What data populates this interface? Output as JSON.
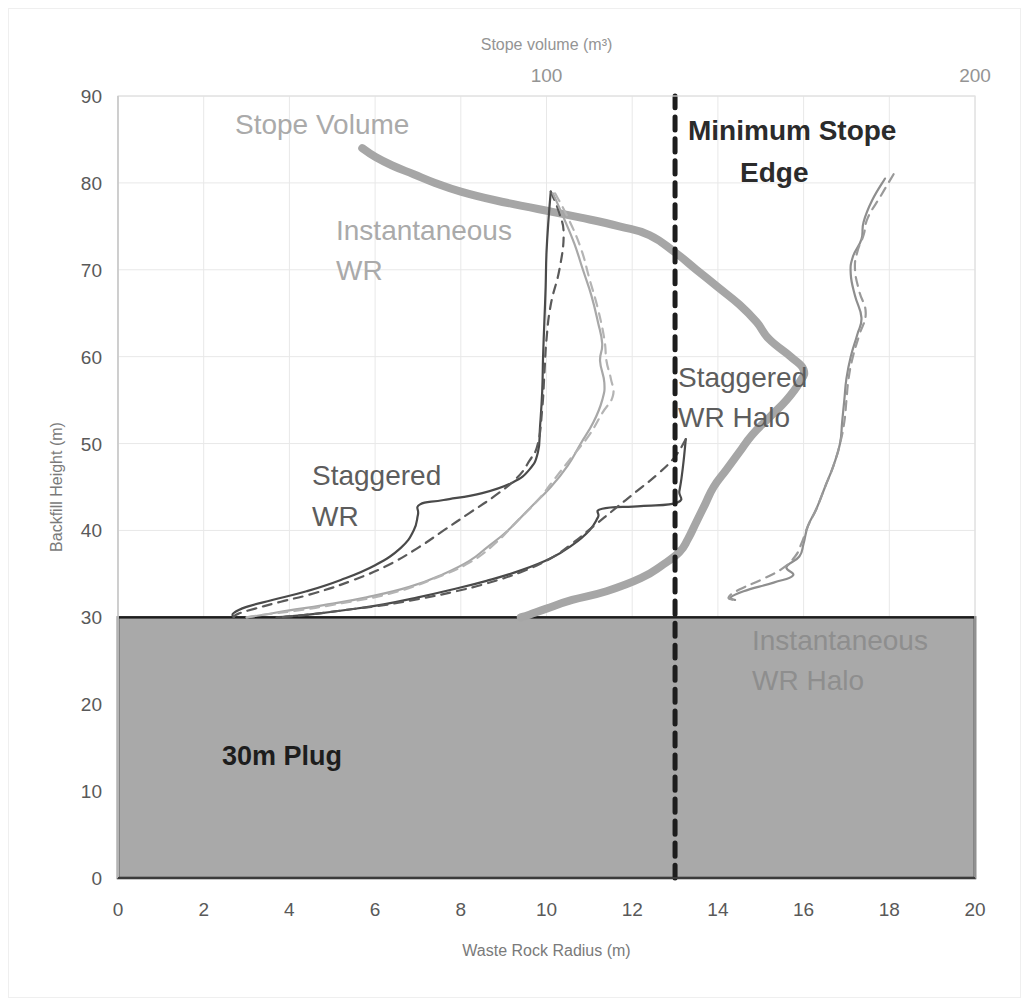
{
  "chart_data": {
    "type": "line",
    "title": "",
    "xlabel": "Waste Rock Radius (m)",
    "ylabel": "Backfill Height (m)",
    "x2label": "Stope volume (m³)",
    "xlim": [
      0,
      20
    ],
    "ylim": [
      0,
      90
    ],
    "x2lim": [
      0,
      200
    ],
    "xticks": [
      0,
      2,
      4,
      6,
      8,
      10,
      12,
      14,
      16,
      18,
      20
    ],
    "yticks": [
      0,
      10,
      20,
      30,
      40,
      50,
      60,
      70,
      80,
      90
    ],
    "x2ticks": [
      100,
      200
    ],
    "grid": true,
    "legend_position": "inline-annotations",
    "series": [
      {
        "name": "Stope Volume",
        "style": "solid-thick",
        "color": "#a6a6a6",
        "axis": "x2",
        "points": [
          [
            57,
            84.0
          ],
          [
            60,
            83.0
          ],
          [
            64,
            82.0
          ],
          [
            69,
            81.0
          ],
          [
            74,
            80.0
          ],
          [
            80,
            79.0
          ],
          [
            88,
            78.0
          ],
          [
            98,
            77.0
          ],
          [
            108,
            76.0
          ],
          [
            117,
            75.0
          ],
          [
            124,
            74.0
          ],
          [
            130,
            72.0
          ],
          [
            135,
            70.0
          ],
          [
            140,
            68.0
          ],
          [
            145,
            66.0
          ],
          [
            149,
            64.0
          ],
          [
            152,
            62.0
          ],
          [
            157,
            60.0
          ],
          [
            160,
            58.5
          ],
          [
            159,
            57.0
          ],
          [
            156,
            55.0
          ],
          [
            152,
            53.0
          ],
          [
            148,
            51.0
          ],
          [
            145,
            49.0
          ],
          [
            142,
            47.0
          ],
          [
            139,
            45.0
          ],
          [
            137,
            43.0
          ],
          [
            135,
            41.0
          ],
          [
            133,
            39.0
          ],
          [
            131,
            37.5
          ],
          [
            127,
            36.0
          ],
          [
            122,
            34.5
          ],
          [
            114,
            33.0
          ],
          [
            106,
            32.0
          ],
          [
            100,
            31.0
          ],
          [
            96,
            30.3
          ],
          [
            94,
            30.0
          ]
        ]
      },
      {
        "name": "Staggered WR",
        "style": "solid-thin",
        "color": "#4a4a4a",
        "axis": "x1",
        "points": [
          [
            10.1,
            79.0
          ],
          [
            10.05,
            76.0
          ],
          [
            10.0,
            72.0
          ],
          [
            9.98,
            68.0
          ],
          [
            9.95,
            64.0
          ],
          [
            9.92,
            60.0
          ],
          [
            9.9,
            56.0
          ],
          [
            9.85,
            52.0
          ],
          [
            9.8,
            49.0
          ],
          [
            9.6,
            47.0
          ],
          [
            9.2,
            45.5
          ],
          [
            8.5,
            44.3
          ],
          [
            7.6,
            43.5
          ],
          [
            7.05,
            43.0
          ],
          [
            7.0,
            41.8
          ],
          [
            6.9,
            40.0
          ],
          [
            6.6,
            38.0
          ],
          [
            6.0,
            36.0
          ],
          [
            5.2,
            34.3
          ],
          [
            4.4,
            33.0
          ],
          [
            3.6,
            32.0
          ],
          [
            3.0,
            31.2
          ],
          [
            2.7,
            30.5
          ],
          [
            2.7,
            30.0
          ]
        ]
      },
      {
        "name": "Staggered WR (dashed)",
        "style": "dashed-thin",
        "color": "#5a5a5a",
        "axis": "x1",
        "points": [
          [
            10.1,
            79.0
          ],
          [
            10.3,
            76.5
          ],
          [
            10.4,
            74.0
          ],
          [
            10.3,
            70.0
          ],
          [
            10.1,
            66.0
          ],
          [
            10.0,
            62.0
          ],
          [
            9.95,
            58.0
          ],
          [
            9.9,
            54.0
          ],
          [
            9.8,
            50.0
          ],
          [
            9.6,
            48.0
          ],
          [
            9.3,
            46.0
          ],
          [
            8.8,
            44.0
          ],
          [
            8.2,
            42.0
          ],
          [
            7.6,
            40.0
          ],
          [
            7.0,
            38.0
          ],
          [
            6.3,
            36.0
          ],
          [
            5.5,
            34.3
          ],
          [
            4.6,
            32.8
          ],
          [
            3.8,
            31.8
          ],
          [
            3.2,
            31.0
          ],
          [
            2.8,
            30.4
          ],
          [
            2.7,
            30.0
          ]
        ]
      },
      {
        "name": "Instantaneous WR",
        "style": "solid-thin",
        "color": "#a8a8a8",
        "axis": "x1",
        "points": [
          [
            10.15,
            78.8
          ],
          [
            10.4,
            76.0
          ],
          [
            10.65,
            73.0
          ],
          [
            10.85,
            70.0
          ],
          [
            11.05,
            67.0
          ],
          [
            11.2,
            64.0
          ],
          [
            11.3,
            61.5
          ],
          [
            11.25,
            59.5
          ],
          [
            11.35,
            57.0
          ],
          [
            11.3,
            55.0
          ],
          [
            11.1,
            52.5
          ],
          [
            10.8,
            50.0
          ],
          [
            10.5,
            47.5
          ],
          [
            10.1,
            45.0
          ],
          [
            9.6,
            42.5
          ],
          [
            9.1,
            40.0
          ],
          [
            8.6,
            38.0
          ],
          [
            8.2,
            36.5
          ],
          [
            7.6,
            35.0
          ],
          [
            6.8,
            33.5
          ],
          [
            5.8,
            32.3
          ],
          [
            4.8,
            31.4
          ],
          [
            4.0,
            30.8
          ],
          [
            3.4,
            30.3
          ],
          [
            3.0,
            30.0
          ]
        ]
      },
      {
        "name": "Instantaneous WR (dashed)",
        "style": "dashed-thin",
        "color": "#b4b4b4",
        "axis": "x1",
        "points": [
          [
            10.2,
            78.8
          ],
          [
            10.5,
            76.0
          ],
          [
            10.8,
            72.5
          ],
          [
            11.0,
            69.0
          ],
          [
            11.2,
            65.5
          ],
          [
            11.35,
            62.0
          ],
          [
            11.4,
            59.5
          ],
          [
            11.5,
            57.5
          ],
          [
            11.55,
            55.5
          ],
          [
            11.3,
            53.5
          ],
          [
            11.0,
            51.0
          ],
          [
            10.6,
            48.5
          ],
          [
            10.2,
            46.0
          ],
          [
            9.8,
            43.5
          ],
          [
            9.3,
            41.0
          ],
          [
            8.8,
            38.5
          ],
          [
            8.2,
            36.3
          ],
          [
            7.4,
            34.5
          ],
          [
            6.4,
            32.8
          ],
          [
            5.2,
            31.6
          ],
          [
            4.2,
            30.8
          ],
          [
            3.4,
            30.3
          ],
          [
            3.0,
            30.0
          ]
        ]
      },
      {
        "name": "Staggered WR Halo",
        "style": "solid-thin",
        "color": "#4a4a4a",
        "axis": "x1",
        "points": [
          [
            13.25,
            50.5
          ],
          [
            13.2,
            48.0
          ],
          [
            13.15,
            46.0
          ],
          [
            13.1,
            44.5
          ],
          [
            13.05,
            43.2
          ],
          [
            12.2,
            42.8
          ],
          [
            11.3,
            42.5
          ],
          [
            11.2,
            41.5
          ],
          [
            11.0,
            40.0
          ],
          [
            10.6,
            38.3
          ],
          [
            10.1,
            36.8
          ],
          [
            9.4,
            35.4
          ],
          [
            8.6,
            34.2
          ],
          [
            7.8,
            33.2
          ],
          [
            7.0,
            32.3
          ],
          [
            6.2,
            31.5
          ],
          [
            5.4,
            30.9
          ],
          [
            4.6,
            30.4
          ],
          [
            4.0,
            30.1
          ],
          [
            3.7,
            30.0
          ]
        ]
      },
      {
        "name": "Staggered WR Halo (dashed)",
        "style": "dashed-thin",
        "color": "#5a5a5a",
        "axis": "x1",
        "points": [
          [
            13.25,
            50.5
          ],
          [
            13.0,
            48.5
          ],
          [
            12.6,
            46.5
          ],
          [
            12.1,
            44.5
          ],
          [
            11.6,
            42.5
          ],
          [
            11.1,
            40.5
          ],
          [
            10.6,
            38.5
          ],
          [
            10.1,
            36.8
          ],
          [
            9.4,
            35.2
          ],
          [
            8.6,
            33.9
          ],
          [
            7.8,
            32.9
          ],
          [
            7.0,
            32.1
          ],
          [
            6.2,
            31.4
          ],
          [
            5.4,
            30.9
          ],
          [
            4.6,
            30.4
          ],
          [
            4.0,
            30.1
          ],
          [
            3.7,
            30.0
          ]
        ]
      },
      {
        "name": "Instantaneous WR Halo",
        "style": "solid-thin",
        "color": "#8e8e8e",
        "axis": "x1",
        "points": [
          [
            17.9,
            80.5
          ],
          [
            17.6,
            78.0
          ],
          [
            17.4,
            75.5
          ],
          [
            17.35,
            73.5
          ],
          [
            17.15,
            71.5
          ],
          [
            17.1,
            69.5
          ],
          [
            17.2,
            67.0
          ],
          [
            17.35,
            64.5
          ],
          [
            17.25,
            62.5
          ],
          [
            17.1,
            60.0
          ],
          [
            17.0,
            57.5
          ],
          [
            16.95,
            55.0
          ],
          [
            16.9,
            52.5
          ],
          [
            16.85,
            50.0
          ],
          [
            16.7,
            47.5
          ],
          [
            16.5,
            45.0
          ],
          [
            16.3,
            42.5
          ],
          [
            16.1,
            40.5
          ],
          [
            16.0,
            38.5
          ],
          [
            15.9,
            37.0
          ],
          [
            15.6,
            35.8
          ],
          [
            15.75,
            34.8
          ],
          [
            15.3,
            34.0
          ],
          [
            14.6,
            33.0
          ],
          [
            14.3,
            32.3
          ],
          [
            14.4,
            32.0
          ]
        ]
      },
      {
        "name": "Instantaneous WR Halo (dashed)",
        "style": "dashed-thin",
        "color": "#9a9a9a",
        "axis": "x1",
        "points": [
          [
            18.1,
            81.0
          ],
          [
            17.8,
            78.5
          ],
          [
            17.5,
            76.0
          ],
          [
            17.4,
            74.0
          ],
          [
            17.25,
            72.0
          ],
          [
            17.2,
            70.0
          ],
          [
            17.3,
            67.5
          ],
          [
            17.45,
            65.0
          ],
          [
            17.3,
            62.5
          ],
          [
            17.15,
            60.0
          ],
          [
            17.05,
            57.5
          ],
          [
            17.0,
            55.0
          ],
          [
            16.95,
            52.5
          ],
          [
            16.85,
            50.0
          ],
          [
            16.7,
            47.5
          ],
          [
            16.5,
            45.0
          ],
          [
            16.3,
            42.5
          ],
          [
            16.1,
            40.5
          ],
          [
            15.95,
            38.5
          ],
          [
            15.8,
            37.0
          ],
          [
            15.5,
            35.6
          ],
          [
            15.0,
            34.3
          ],
          [
            14.5,
            33.2
          ],
          [
            14.25,
            32.3
          ],
          [
            14.4,
            32.0
          ]
        ]
      },
      {
        "name": "Minimum Stope Edge",
        "style": "dashed-thick",
        "color": "#1d1d1d",
        "axis": "x1",
        "points": [
          [
            13,
            0
          ],
          [
            13,
            90
          ]
        ]
      }
    ],
    "regions": [
      {
        "name": "30m Plug",
        "x_range": [
          0,
          20
        ],
        "y_range": [
          0,
          30
        ],
        "fill": "#a9a9a9",
        "border": "#1d1d1d"
      }
    ],
    "annotations": [
      {
        "key": "stope_volume",
        "text": "Stope Volume",
        "x": 235,
        "y": 134,
        "color": "#aaaaaa"
      },
      {
        "key": "minimum_stope_edge_1",
        "text": "Minimum Stope",
        "x": 688,
        "y": 140,
        "color": "#2b2b2b"
      },
      {
        "key": "minimum_stope_edge_2",
        "text": "Edge",
        "x": 740,
        "y": 182,
        "color": "#2b2b2b"
      },
      {
        "key": "instantaneous_wr_1",
        "text": "Instantaneous",
        "x": 336,
        "y": 240,
        "color": "#aaaaaa"
      },
      {
        "key": "instantaneous_wr_2",
        "text": "WR",
        "x": 336,
        "y": 280,
        "color": "#aaaaaa"
      },
      {
        "key": "staggered_wr_halo_1",
        "text": "Staggered",
        "x": 678,
        "y": 387,
        "color": "#5d5d5d"
      },
      {
        "key": "staggered_wr_halo_2",
        "text": "WR Halo",
        "x": 678,
        "y": 427,
        "color": "#5d5d5d"
      },
      {
        "key": "staggered_wr_1",
        "text": "Staggered",
        "x": 312,
        "y": 485,
        "color": "#5d5d5d"
      },
      {
        "key": "staggered_wr_2",
        "text": "WR",
        "x": 312,
        "y": 526,
        "color": "#5d5d5d"
      },
      {
        "key": "inst_wr_halo_1",
        "text": "Instantaneous",
        "x": 752,
        "y": 650,
        "color": "#8e8e8e"
      },
      {
        "key": "inst_wr_halo_2",
        "text": "WR Halo",
        "x": 752,
        "y": 690,
        "color": "#8e8e8e"
      },
      {
        "key": "plug_label",
        "text": "30m Plug",
        "x": 222,
        "y": 765,
        "color": "#1d1d1d"
      }
    ]
  },
  "axes": {
    "x_title": "Waste Rock Radius (m)",
    "y_title": "Backfill Height (m)",
    "x2_title": "Stope volume (m³)",
    "x_tick_labels": [
      "0",
      "2",
      "4",
      "6",
      "8",
      "10",
      "12",
      "14",
      "16",
      "18",
      "20"
    ],
    "y_tick_labels": [
      "0",
      "10",
      "20",
      "30",
      "40",
      "50",
      "60",
      "70",
      "80",
      "90"
    ],
    "x2_tick_labels": [
      "100",
      "200"
    ]
  },
  "colors": {
    "plug_fill": "#a9a9a9",
    "plug_border": "#1d1d1d",
    "grid": "#e8e8e8",
    "stope_volume": "#a6a6a6",
    "staggered": "#4a4a4a",
    "instantaneous": "#a8a8a8",
    "halo_instantaneous": "#8e8e8e",
    "min_edge": "#1d1d1d",
    "tick_text": "#595959",
    "tick_text_top": "#949494",
    "axis_title_text": "#7a7a7a"
  }
}
